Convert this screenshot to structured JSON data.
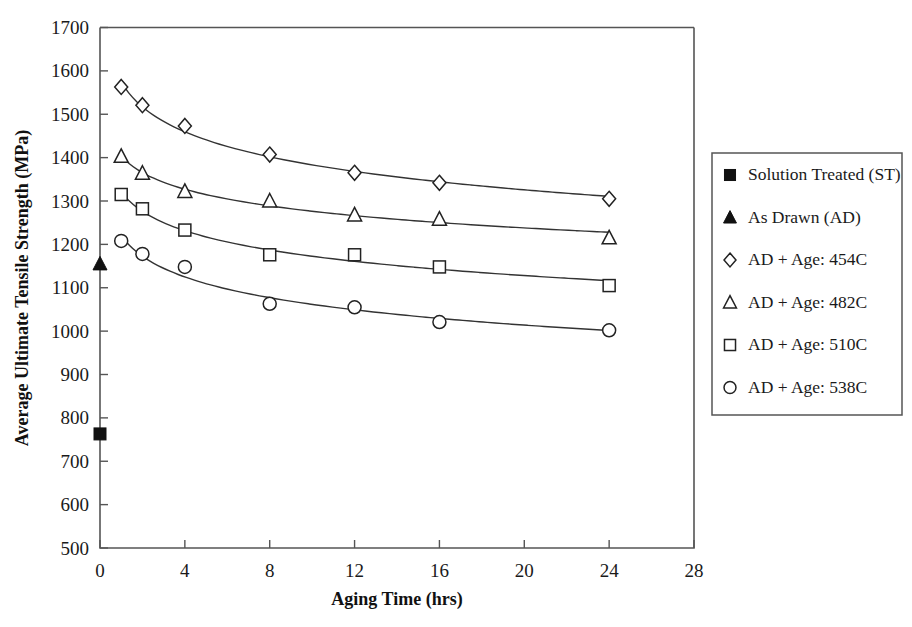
{
  "chart_data": {
    "type": "scatter",
    "title": "",
    "xlabel": "Aging Time (hrs)",
    "ylabel": "Average Ultimate Tensile Strength (MPa)",
    "xlim": [
      0,
      28
    ],
    "ylim": [
      500,
      1700
    ],
    "xticks": [
      0,
      4,
      8,
      12,
      16,
      20,
      24,
      28
    ],
    "yticks": [
      500,
      600,
      700,
      800,
      900,
      1000,
      1100,
      1200,
      1300,
      1400,
      1500,
      1600,
      1700
    ],
    "grid": false,
    "legend_position": "right",
    "series": [
      {
        "name": "Solution Treated (ST)",
        "marker": "filled-square",
        "fitline": false,
        "x": [
          0
        ],
        "y": [
          763
        ]
      },
      {
        "name": "As Drawn (AD)",
        "marker": "filled-triangle",
        "fitline": false,
        "x": [
          0
        ],
        "y": [
          1155
        ]
      },
      {
        "name": "AD + Age: 454C",
        "marker": "open-diamond",
        "fitline": true,
        "x": [
          1,
          2,
          4,
          8,
          12,
          16,
          24
        ],
        "y": [
          1563,
          1521,
          1473,
          1407,
          1365,
          1342,
          1305
        ]
      },
      {
        "name": "AD + Age: 482C",
        "marker": "open-triangle",
        "fitline": true,
        "x": [
          1,
          2,
          4,
          8,
          12,
          16,
          24
        ],
        "y": [
          1403,
          1364,
          1322,
          1300,
          1268,
          1258,
          1215
        ]
      },
      {
        "name": "AD + Age: 510C",
        "marker": "open-square",
        "fitline": true,
        "x": [
          1,
          2,
          4,
          8,
          12,
          16,
          24
        ],
        "y": [
          1315,
          1282,
          1233,
          1176,
          1176,
          1148,
          1105
        ]
      },
      {
        "name": "AD + Age: 538C",
        "marker": "open-circle",
        "fitline": true,
        "x": [
          1,
          2,
          4,
          8,
          12,
          16,
          24
        ],
        "y": [
          1208,
          1178,
          1148,
          1063,
          1055,
          1021,
          1002
        ]
      }
    ]
  },
  "legend": {
    "items": [
      {
        "label": "Solution Treated (ST)",
        "marker": "filled-square"
      },
      {
        "label": "As Drawn (AD)",
        "marker": "filled-triangle"
      },
      {
        "label": "AD + Age: 454C",
        "marker": "open-diamond"
      },
      {
        "label": "AD + Age: 482C",
        "marker": "open-triangle"
      },
      {
        "label": "AD + Age: 510C",
        "marker": "open-square"
      },
      {
        "label": "AD + Age: 538C",
        "marker": "open-circle"
      }
    ]
  }
}
